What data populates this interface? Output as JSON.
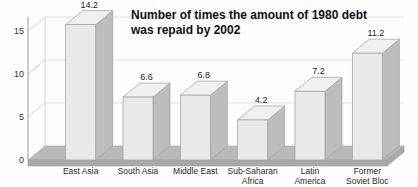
{
  "chart_data": {
    "type": "bar",
    "title": "Number of times the amount of 1980 debt was repaid by 2002",
    "title_line1": "Number of times the amount of 1980 debt",
    "title_line2": "was repaid by 2002",
    "xlabel": "",
    "ylabel": "",
    "ylim": [
      0,
      15
    ],
    "yticks": [
      "0",
      "5",
      "10",
      "15"
    ],
    "grid": true,
    "legend": "none",
    "style": "3d-columns-grayscale",
    "categories": [
      "East Asia",
      "South Asia",
      "Middle East",
      "Sub-Saharan Africa",
      "Latin America",
      "Former Soviet Bloc"
    ],
    "category_lines": [
      [
        "East Asia"
      ],
      [
        "South Asia"
      ],
      [
        "Middle East"
      ],
      [
        "Sub-Saharan",
        "Africa"
      ],
      [
        "Latin",
        "America"
      ],
      [
        "Former",
        "Soviet Bloc"
      ]
    ],
    "values": [
      14.2,
      6.6,
      6.8,
      4.2,
      7.2,
      11.2
    ],
    "value_labels": [
      "14.2",
      "6.6",
      "6.8",
      "4.2",
      "7.2",
      "11.2"
    ]
  },
  "colors": {
    "background": "#fdfdfd",
    "bar_front": "#e9e9e9",
    "bar_side": "#bdbdbd",
    "bar_top": "#f0f0f0",
    "bar_edge": "#9f9f9f",
    "floor": "#b9b9b9",
    "gridline": "#d9d9d9",
    "axis": "#9a9a9a",
    "title_text": "#111111",
    "label_text": "#2a2a2a"
  }
}
